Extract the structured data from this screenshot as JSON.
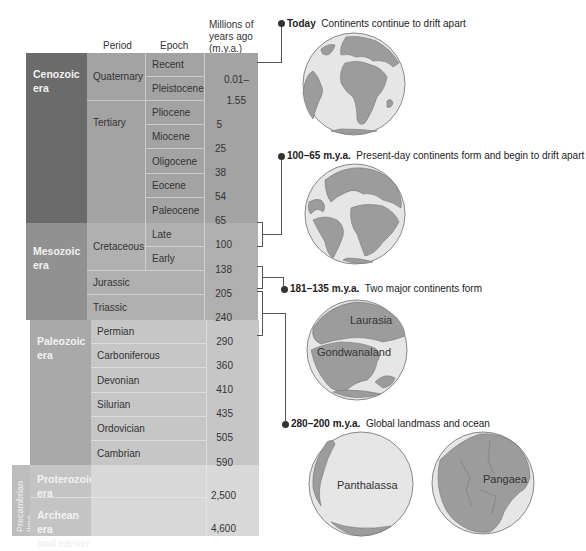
{
  "headers": {
    "period": "Period",
    "epoch": "Epoch",
    "mya_line1": "Millions of",
    "mya_line2": "years ago",
    "mya_line3": "(m.y.a.)"
  },
  "eras": [
    {
      "line1": "Cenozoic",
      "line2": "era"
    },
    {
      "line1": "Mesozoic",
      "line2": "era"
    },
    {
      "line1": "Paleozoic",
      "line2": "era"
    },
    {
      "line1": "Proterozoic",
      "line2": "era"
    },
    {
      "line1": "Archean era",
      "line2": "and earlier"
    }
  ],
  "precambrian_label": "Precambrian time",
  "periods": [
    "Quaternary",
    "Tertiary",
    "Cretaceous",
    "Jurassic",
    "Triassic",
    "Permian",
    "Carboniferous",
    "Devonian",
    "Silurian",
    "Ordovician",
    "Cambrian"
  ],
  "epochs": [
    "Recent",
    "Pleistocene",
    "Pliocene",
    "Miocene",
    "Oligocene",
    "Eocene",
    "Paleocene",
    "Late",
    "Early"
  ],
  "mya_values": [
    "0.01–",
    "1.55",
    "5",
    "25",
    "38",
    "54",
    "65",
    "100",
    "138",
    "205",
    "240",
    "290",
    "360",
    "410",
    "435",
    "505",
    "590",
    "2,500",
    "4,600"
  ],
  "captions": [
    {
      "bold": "Today",
      "text": "Continents continue to drift apart"
    },
    {
      "bold": "100–65 m.y.a.",
      "text": "Present-day continents form and begin to drift apart"
    },
    {
      "bold": "181–135 m.y.a.",
      "text": "Two major continents form"
    },
    {
      "bold": "280–200 m.y.a.",
      "text": "Global landmass and ocean"
    }
  ],
  "globe_labels": {
    "laurasia": "Laurasia",
    "gondwanaland": "Gondwanaland",
    "panthalassa": "Panthalassa",
    "pangaea": "Pangaea"
  },
  "colors": {
    "cenozoic_era": "#6b6b6b",
    "cenozoic_period": "#9a9a9a",
    "mesozoic_era": "#8e8e8e",
    "mesozoic_period": "#adadad",
    "paleozoic_era": "#a6a6a6",
    "paleozoic_period": "#c4c4c4",
    "precambrian": "#bdbdbd",
    "precambrian_fill": "#d6d6d6",
    "land": "#9c9c9c",
    "ocean": "#e6e6e6"
  }
}
